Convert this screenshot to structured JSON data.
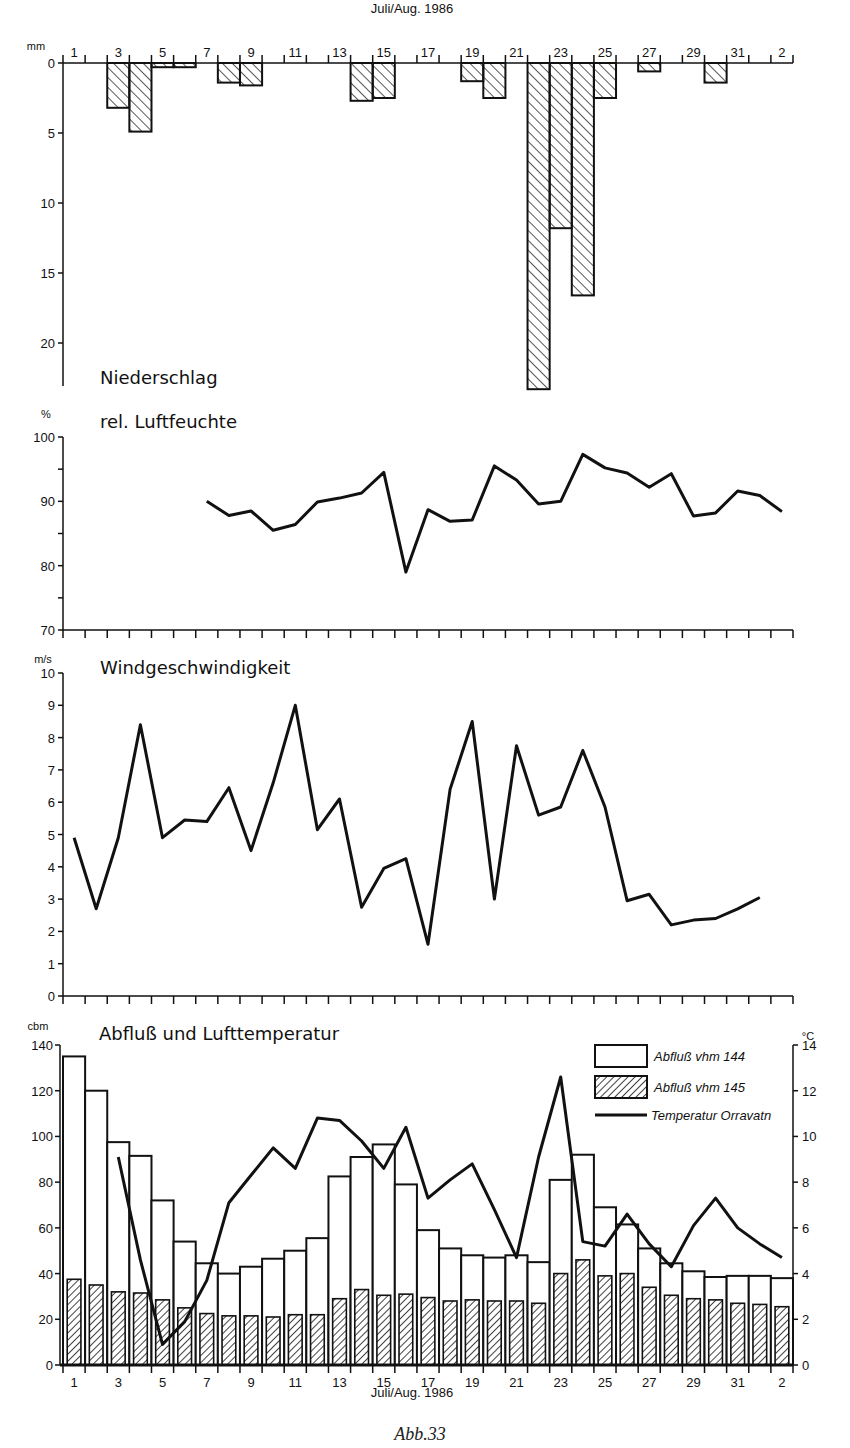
{
  "figure": {
    "caption": "Abb.33",
    "date_axis_label": "Juli/Aug. 1986"
  },
  "panels": {
    "precip": {
      "title": "Niederschlag",
      "unit": "mm"
    },
    "humidity": {
      "title": "rel. Luftfeuchte",
      "unit": "%"
    },
    "wind": {
      "title": "Windgeschwindigkeit",
      "unit": "m/s"
    },
    "runoff": {
      "title": "Abfluß und Lufttemperatur",
      "unit_left": "cbm",
      "unit_right": "°C",
      "legend": [
        {
          "label": "Abfluß vhm 144",
          "style": "open-bar"
        },
        {
          "label": "Abfluß vhm 145",
          "style": "hatched-bar"
        },
        {
          "label": "Temperatur Orravatn",
          "style": "line"
        }
      ]
    }
  },
  "chart_data": [
    {
      "type": "bar",
      "title": "Niederschlag",
      "xlabel": "Juli/Aug. 1986",
      "ylabel": "mm",
      "ylim": [
        0,
        23
      ],
      "y_inverted": true,
      "categories": [
        "1",
        "2",
        "3",
        "4",
        "5",
        "6",
        "7",
        "8",
        "9",
        "10",
        "11",
        "12",
        "13",
        "14",
        "15",
        "16",
        "17",
        "18",
        "19",
        "20",
        "21",
        "22",
        "23",
        "24",
        "25",
        "26",
        "27",
        "28",
        "29",
        "30",
        "31",
        "1",
        "2"
      ],
      "x_tick_labels": [
        "1",
        "3",
        "5",
        "7",
        "9",
        "11",
        "13",
        "15",
        "17",
        "19",
        "21",
        "23",
        "25",
        "27",
        "29",
        "31",
        "2"
      ],
      "y_ticks": [
        0,
        5,
        10,
        15,
        20
      ],
      "values": [
        0,
        0,
        3.2,
        4.9,
        0.3,
        0.3,
        0,
        1.4,
        1.6,
        0,
        0,
        0,
        0,
        2.7,
        2.5,
        0,
        0,
        0,
        1.3,
        2.5,
        0,
        23.3,
        11.8,
        16.6,
        2.5,
        0,
        0.6,
        0,
        0,
        1.4,
        0,
        0,
        0
      ]
    },
    {
      "type": "line",
      "title": "rel. Luftfeuchte",
      "ylabel": "%",
      "ylim": [
        70,
        100
      ],
      "y_ticks": [
        70,
        80,
        90,
        100
      ],
      "categories": [
        "1",
        "2",
        "3",
        "4",
        "5",
        "6",
        "7",
        "8",
        "9",
        "10",
        "11",
        "12",
        "13",
        "14",
        "15",
        "16",
        "17",
        "18",
        "19",
        "20",
        "21",
        "22",
        "23",
        "24",
        "25",
        "26",
        "27",
        "28",
        "29",
        "30",
        "31",
        "1",
        "2"
      ],
      "values": [
        null,
        null,
        null,
        null,
        null,
        null,
        90,
        87.8,
        88.5,
        85.5,
        86.4,
        89.9,
        90.5,
        91.3,
        94.5,
        79,
        88.7,
        86.9,
        87.1,
        95.5,
        93.3,
        89.6,
        90,
        97.3,
        95.2,
        94.4,
        92.2,
        94.3,
        87.7,
        88.2,
        91.6,
        90.9,
        88.4
      ]
    },
    {
      "type": "line",
      "title": "Windgeschwindigkeit",
      "ylabel": "m/s",
      "ylim": [
        0,
        10
      ],
      "y_ticks": [
        0,
        1,
        2,
        3,
        4,
        5,
        6,
        7,
        8,
        9,
        10
      ],
      "categories": [
        "1",
        "2",
        "3",
        "4",
        "5",
        "6",
        "7",
        "8",
        "9",
        "10",
        "11",
        "12",
        "13",
        "14",
        "15",
        "16",
        "17",
        "18",
        "19",
        "20",
        "21",
        "22",
        "23",
        "24",
        "25",
        "26",
        "27",
        "28",
        "29",
        "30",
        "31",
        "1",
        "2"
      ],
      "values": [
        4.9,
        2.7,
        4.9,
        8.4,
        4.9,
        5.45,
        5.4,
        6.45,
        4.5,
        6.6,
        9.0,
        5.15,
        6.1,
        2.75,
        3.95,
        4.25,
        1.6,
        6.4,
        8.5,
        3.0,
        7.75,
        5.6,
        5.85,
        7.6,
        5.85,
        2.95,
        3.15,
        2.2,
        2.35,
        2.4,
        2.7,
        3.05
      ]
    },
    {
      "type": "bar",
      "title": "Abfluß und Lufttemperatur",
      "xlabel": "Juli/Aug. 1986",
      "ylabel": "cbm",
      "ylabel_right": "°C",
      "ylim": [
        0,
        140
      ],
      "ylim_right": [
        0,
        14
      ],
      "y_ticks": [
        0,
        20,
        40,
        60,
        80,
        100,
        120,
        140
      ],
      "y_ticks_right": [
        0,
        2,
        4,
        6,
        8,
        10,
        12,
        14
      ],
      "legend_position": "upper right",
      "categories": [
        "1",
        "2",
        "3",
        "4",
        "5",
        "6",
        "7",
        "8",
        "9",
        "10",
        "11",
        "12",
        "13",
        "14",
        "15",
        "16",
        "17",
        "18",
        "19",
        "20",
        "21",
        "22",
        "23",
        "24",
        "25",
        "26",
        "27",
        "28",
        "29",
        "30",
        "31",
        "1",
        "2"
      ],
      "x_tick_labels": [
        "1",
        "3",
        "5",
        "7",
        "9",
        "11",
        "13",
        "15",
        "17",
        "19",
        "21",
        "23",
        "25",
        "27",
        "29",
        "31",
        "2"
      ],
      "series": [
        {
          "name": "Abfluß vhm 144",
          "type": "bar",
          "axis": "left",
          "values": [
            135,
            120,
            97.5,
            91.5,
            72,
            54,
            44.5,
            40,
            43,
            46.5,
            50,
            55.5,
            82.5,
            91,
            96.5,
            79,
            59,
            51,
            48,
            47,
            48,
            45,
            81,
            92,
            69,
            61.5,
            51,
            44.5,
            41,
            38.5,
            39,
            39,
            38
          ]
        },
        {
          "name": "Abfluß vhm 145",
          "type": "bar",
          "axis": "left",
          "values": [
            37.5,
            35,
            32,
            31.5,
            28.5,
            25,
            22.5,
            21.5,
            21.5,
            21,
            22,
            22,
            29,
            33,
            30.5,
            31,
            29.5,
            28,
            28.5,
            28,
            28,
            27,
            40,
            46,
            39,
            40,
            34,
            30.5,
            29,
            28.5,
            27,
            26.5,
            25.5
          ]
        },
        {
          "name": "Temperatur Orravatn",
          "type": "line",
          "axis": "right",
          "values": [
            null,
            null,
            9.1,
            4.6,
            0.9,
            1.9,
            3.7,
            7.1,
            8.3,
            9.5,
            8.6,
            10.8,
            10.7,
            9.8,
            8.6,
            10.4,
            7.3,
            8.1,
            8.8,
            6.8,
            4.7,
            9.1,
            12.6,
            5.4,
            5.2,
            6.6,
            5.3,
            4.3,
            6.1,
            7.3,
            6.0,
            5.3,
            4.7
          ]
        }
      ]
    }
  ]
}
